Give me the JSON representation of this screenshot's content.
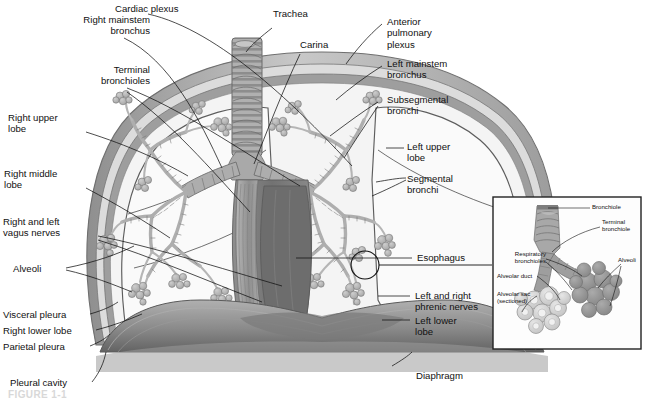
{
  "figure": {
    "caption_partial": "FIGURE 1-1",
    "colors": {
      "background": "#ffffff",
      "text": "#111111",
      "leader_line": "#111111",
      "chest_wall_outer": "#9a9a9a",
      "parietal_pleura": "#8c8c8c",
      "pleural_cavity": "#d9d9d9",
      "visceral_pleura": "#6e6e6e",
      "lung_field": "#f2f2f2",
      "airway_gray": "#a8a8a8",
      "airway_outline": "#6f6f6f",
      "alveoli_cluster": "#b4b4b4",
      "mediastinum": "#8a8a8a",
      "esophagus": "#9e9e9e",
      "heart_shadow": "#6a6a6a",
      "diaphragm": "#8f8f8f",
      "diaphragm_dark": "#5f5f5f",
      "inset_border": "#222222",
      "inset_alveoli_light": "#cfcfcf",
      "inset_alveoli_dark": "#9a9a9a",
      "inset_bronchiole": "#a0a0a0"
    }
  },
  "labels_left": [
    {
      "id": "right-mainstem-bronchus",
      "text": "Right mainstem\nbronchus"
    },
    {
      "id": "terminal-bronchioles",
      "text": "Terminal\nbronchioles"
    },
    {
      "id": "right-upper-lobe",
      "text": "Right upper\nlobe"
    },
    {
      "id": "right-middle-lobe",
      "text": "Right middle\nlobe"
    },
    {
      "id": "right-and-left-vagus-nerves",
      "text": "Right and left\nvagus nerves"
    },
    {
      "id": "alveoli",
      "text": "Alveoli"
    },
    {
      "id": "visceral-pleura",
      "text": "Visceral pleura"
    },
    {
      "id": "right-lower-lobe",
      "text": "Right lower lobe"
    },
    {
      "id": "parietal-pleura",
      "text": "Parietal pleura"
    },
    {
      "id": "pleural-cavity",
      "text": "Pleural cavity"
    }
  ],
  "labels_top": [
    {
      "id": "cardiac-plexus",
      "text": "Cardiac plexus"
    },
    {
      "id": "trachea",
      "text": "Trachea"
    },
    {
      "id": "carina",
      "text": "Carina"
    }
  ],
  "labels_right": [
    {
      "id": "anterior-pulmonary-plexus",
      "text": "Anterior\npulmonary\nplexus"
    },
    {
      "id": "left-mainstem-bronchus",
      "text": "Left mainstem\nbronchus"
    },
    {
      "id": "subsegmental-bronchi",
      "text": "Subsegmental\nbronchi"
    },
    {
      "id": "left-upper-lobe",
      "text": "Left upper\nlobe"
    },
    {
      "id": "segmental-bronchi",
      "text": "Segmental\nbronchi"
    },
    {
      "id": "esophagus",
      "text": "Esophagus"
    },
    {
      "id": "left-and-right-phrenic-nerves",
      "text": "Left and right\nphrenic nerves"
    },
    {
      "id": "left-lower-lobe",
      "text": "Left lower\nlobe"
    },
    {
      "id": "diaphragm",
      "text": "Diaphragm"
    }
  ],
  "inset": {
    "title": "Alveolar unit detail",
    "labels": [
      {
        "id": "bronchiole",
        "text": "Bronchiole"
      },
      {
        "id": "terminal-bronchiole",
        "text": "Terminal\nbronchiole"
      },
      {
        "id": "respiratory-bronchioles",
        "text": "Respiratory\nbronchioles"
      },
      {
        "id": "alveoli",
        "text": "Alveoli"
      },
      {
        "id": "alveolar-duct",
        "text": "Alveolar duct"
      },
      {
        "id": "alveolar-sac-sectioned",
        "text": "Alveolar sac\n(sectioned)"
      }
    ]
  }
}
